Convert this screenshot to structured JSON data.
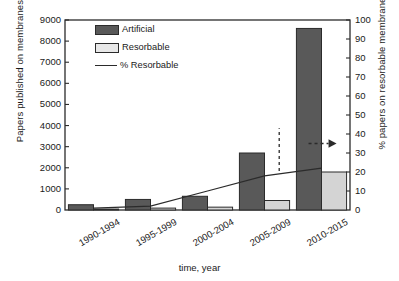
{
  "chart_data": {
    "type": "bar",
    "title": "",
    "xlabel": "time, year",
    "ylabel": "Papers published on membranes in TE",
    "ylabel_secondary": "% papers on resorbable membranes in TE",
    "categories": [
      "1990-1994",
      "1995-1999",
      "2000-2004",
      "2005-2009",
      "2010-2015"
    ],
    "ylim": [
      0,
      9000
    ],
    "ylim_secondary": [
      0,
      100
    ],
    "yticks": [
      0,
      1000,
      2000,
      3000,
      4000,
      5000,
      6000,
      7000,
      8000,
      9000
    ],
    "yticks_secondary": [
      0,
      10,
      20,
      30,
      40,
      50,
      60,
      70,
      80,
      90,
      100
    ],
    "grid": false,
    "legend_position": "top-left",
    "series": [
      {
        "name": "Artificial",
        "type": "bar",
        "axis": "left",
        "color": "#595959",
        "values": [
          250,
          500,
          650,
          2700,
          8600
        ]
      },
      {
        "name": "Resorbable",
        "type": "bar",
        "axis": "right",
        "color": "#d4d4d4",
        "values": [
          0.5,
          1,
          1.5,
          5,
          20
        ]
      },
      {
        "name": "% Resorbable",
        "type": "line",
        "axis": "right",
        "color": "#2b2b2b",
        "values": [
          1,
          2,
          10,
          18,
          22
        ]
      }
    ],
    "annotations": [
      {
        "name": "dashed-vertical-line",
        "x_category": "2005-2009"
      },
      {
        "name": "dashed-right-arrow",
        "x_category": "2010-2015",
        "value": 35
      }
    ]
  },
  "legend": {
    "items": [
      {
        "label": "Artificial",
        "marker": "filled-dark-rect"
      },
      {
        "label": "Resorbable",
        "marker": "filled-light-rect"
      },
      {
        "label": "% Resorbable",
        "marker": "line"
      }
    ]
  }
}
